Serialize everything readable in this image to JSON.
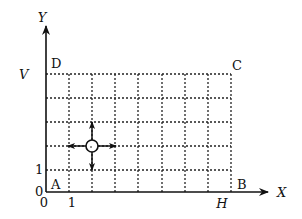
{
  "diagram": {
    "axes": {
      "x_label": "X",
      "y_label": "Y",
      "x_ticks": [
        "0",
        "1"
      ],
      "y_ticks": [
        "0",
        "1"
      ],
      "x_extent_label": "H",
      "y_extent_label": "V"
    },
    "corners": {
      "A": "A",
      "B": "B",
      "C": "C",
      "D": "D"
    },
    "grid": {
      "columns": 8,
      "rows": 5,
      "style": "dotted"
    },
    "robot": {
      "symbol": "circle-with-four-arrows",
      "arrows": [
        "up",
        "down",
        "left",
        "right"
      ]
    },
    "colors": {
      "line": "#111111",
      "background": "#ffffff"
    }
  }
}
